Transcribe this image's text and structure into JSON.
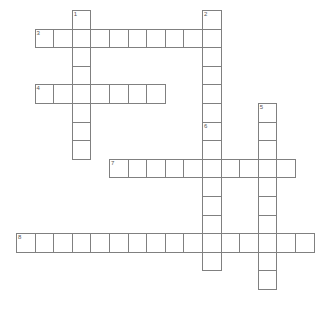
{
  "puzzle": {
    "title": "Crossword Puzzle Grid",
    "background_color": "#ffffff",
    "cell_fill_color": "#ffffff",
    "cell_border_color": "#808080",
    "number_color": "#555555",
    "cell_size": 18.6,
    "origin_x": 16,
    "origin_y": 10,
    "columns": 16,
    "rows": 16,
    "state": "empty",
    "entries": [
      {
        "number": "1",
        "direction": "down",
        "row": 0,
        "col": 3,
        "length": 8,
        "letters": ""
      },
      {
        "number": "2",
        "direction": "down",
        "row": 0,
        "col": 10,
        "length": 10,
        "letters": ""
      },
      {
        "number": "3",
        "direction": "across",
        "row": 1,
        "col": 1,
        "length": 10,
        "letters": ""
      },
      {
        "number": "4",
        "direction": "across",
        "row": 4,
        "col": 1,
        "length": 7,
        "letters": ""
      },
      {
        "number": "5",
        "direction": "down",
        "row": 5,
        "col": 13,
        "length": 10,
        "letters": ""
      },
      {
        "number": "6",
        "direction": "down",
        "row": 6,
        "col": 10,
        "length": 8,
        "letters": ""
      },
      {
        "number": "7",
        "direction": "across",
        "row": 8,
        "col": 5,
        "length": 10,
        "letters": ""
      },
      {
        "number": "8",
        "direction": "across",
        "row": 12,
        "col": 0,
        "length": 16,
        "letters": ""
      }
    ]
  }
}
